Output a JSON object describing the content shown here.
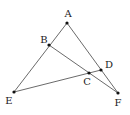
{
  "diagram": {
    "type": "geometry-figure",
    "points": [
      {
        "name": "A",
        "x": 67,
        "y": 23,
        "lx": 68,
        "ly": 17
      },
      {
        "name": "B",
        "x": 49,
        "y": 45,
        "lx": 44,
        "ly": 43
      },
      {
        "name": "C",
        "x": 89,
        "y": 73,
        "lx": 87,
        "ly": 85
      },
      {
        "name": "D",
        "x": 101,
        "y": 70,
        "lx": 109,
        "ly": 68
      },
      {
        "name": "E",
        "x": 14,
        "y": 92,
        "lx": 9,
        "ly": 104
      },
      {
        "name": "F",
        "x": 118,
        "y": 93,
        "lx": 118,
        "ly": 106
      }
    ],
    "segments": [
      {
        "from": "A",
        "to": "E"
      },
      {
        "from": "A",
        "to": "F"
      },
      {
        "from": "B",
        "to": "F"
      },
      {
        "from": "E",
        "to": "D"
      }
    ],
    "labels": {
      "A": "A",
      "B": "B",
      "C": "C",
      "D": "D",
      "E": "E",
      "F": "F"
    },
    "colors": {
      "line": "#444444",
      "point": "#111111",
      "text": "#222222",
      "background": "#ffffff"
    }
  }
}
